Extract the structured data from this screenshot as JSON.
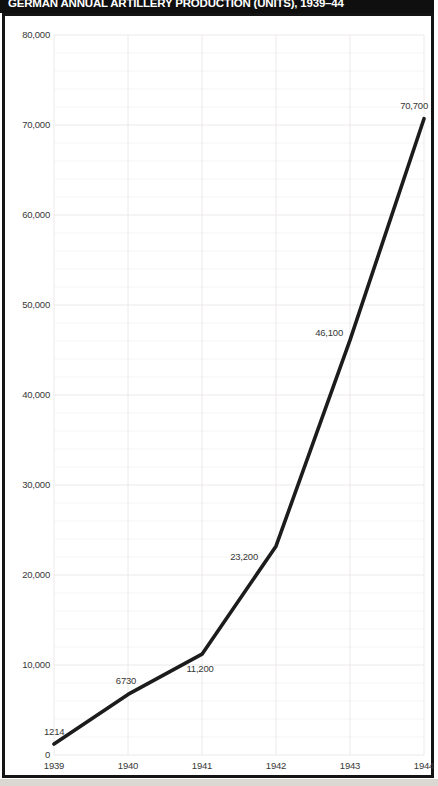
{
  "title": "GERMAN ANNUAL ARTILLERY PRODUCTION (UNITS), 1939–44",
  "colors": {
    "title_band_bg": "#0f0f0f",
    "title_text": "#ffffff",
    "frame_border": "#141414",
    "line": "#1c1c1c",
    "grid_major": "#ece9e8",
    "grid_minor": "#f7f5f4",
    "axis_text": "#383838",
    "outer_strip": "#dbd8d2"
  },
  "chart_data": {
    "type": "line",
    "title": "GERMAN ANNUAL ARTILLERY PRODUCTION (UNITS), 1939–44",
    "categories": [
      "1939",
      "1940",
      "1941",
      "1942",
      "1943",
      "1944"
    ],
    "values": [
      1214,
      6730,
      11200,
      23200,
      46100,
      70700
    ],
    "point_labels": [
      "1214",
      "6730",
      "11,200",
      "23,200",
      "46,100",
      "70,700"
    ],
    "point_label_pos": [
      {
        "dx": -10,
        "dy": -9,
        "anchor": "start"
      },
      {
        "dx": -2,
        "dy": -10,
        "anchor": "middle"
      },
      {
        "dx": -2,
        "dy": 18,
        "anchor": "middle"
      },
      {
        "dx": -18,
        "dy": 14,
        "anchor": "end"
      },
      {
        "dx": -7,
        "dy": -4,
        "anchor": "end"
      },
      {
        "dx": 4,
        "dy": -10,
        "anchor": "end"
      }
    ],
    "xlabel": "",
    "ylabel": "",
    "ylim": [
      0,
      80000
    ],
    "y_ticks": [
      {
        "v": 0,
        "label": "0"
      },
      {
        "v": 10000,
        "label": "10,000"
      },
      {
        "v": 20000,
        "label": "20,000"
      },
      {
        "v": 30000,
        "label": "30,000"
      },
      {
        "v": 40000,
        "label": "40,000"
      },
      {
        "v": 50000,
        "label": "50,000"
      },
      {
        "v": 60000,
        "label": "60,000"
      },
      {
        "v": 70000,
        "label": "70,000"
      },
      {
        "v": 80000,
        "label": "80,000"
      }
    ],
    "grid": {
      "h_major_step": 10000,
      "h_minor_step": 2000,
      "vertical": "per-category",
      "visible": "very-faint"
    },
    "legend": "none"
  }
}
